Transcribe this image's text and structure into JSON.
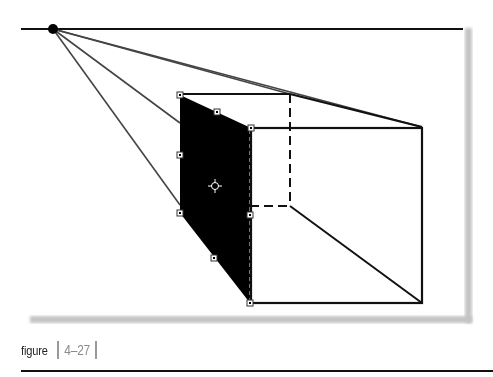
{
  "figure": {
    "caption_label": "figure",
    "caption_number": "4–27",
    "colors": {
      "line": "#111111",
      "perspective_line": "#444444",
      "shadow": "#bdbdbd",
      "caption_number": "#8a8a8a",
      "caption_bar": "#9a9a9a",
      "fill": "#000000"
    },
    "horizon": {
      "x1": 21,
      "y1": 29,
      "x2": 463,
      "y2": 29
    },
    "vanishing_point": {
      "x": 53,
      "y": 29,
      "r": 5
    },
    "perspective_lines": [
      {
        "x1": 53,
        "y1": 29,
        "x2": 422,
        "y2": 127
      },
      {
        "x1": 53,
        "y1": 29,
        "x2": 290,
        "y2": 94
      },
      {
        "x1": 53,
        "y1": 29,
        "x2": 180,
        "y2": 123
      },
      {
        "x1": 53,
        "y1": 29,
        "x2": 180,
        "y2": 205
      }
    ],
    "front_face": {
      "x": 251,
      "y": 128,
      "width": 171,
      "height": 175
    },
    "back_face": {
      "x": 180,
      "y": 94,
      "width": 110,
      "height": 112
    },
    "shaded_face": {
      "points": "180,95 251,128 250,303 180,213"
    },
    "handles": [
      {
        "x": 180,
        "y": 95
      },
      {
        "x": 217,
        "y": 112
      },
      {
        "x": 251,
        "y": 128
      },
      {
        "x": 180,
        "y": 155
      },
      {
        "x": 250,
        "y": 215
      },
      {
        "x": 180,
        "y": 213
      },
      {
        "x": 214,
        "y": 258
      },
      {
        "x": 250,
        "y": 303
      }
    ],
    "center_marker": {
      "x": 215,
      "y": 186
    }
  }
}
